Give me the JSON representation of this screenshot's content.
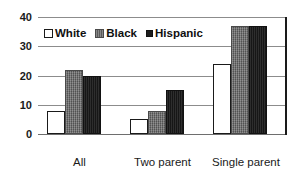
{
  "chart_data": {
    "type": "bar",
    "title": "",
    "subtitle": "",
    "xlabel": "",
    "ylabel": "",
    "ylim": [
      0,
      40
    ],
    "yticks": [
      0,
      10,
      20,
      30,
      40
    ],
    "grid": true,
    "legend_position": "inside-top-left",
    "categories": [
      "All\nfamilies",
      "Two parent\nfamilies",
      "Single parent\nfamilies"
    ],
    "series": [
      {
        "name": "White",
        "values": [
          8,
          5,
          24
        ],
        "fill": "#ffffff",
        "pattern": "open-outline"
      },
      {
        "name": "Black",
        "values": [
          22,
          8,
          37
        ],
        "fill": "#6b6b6b",
        "pattern": "gray-hatched"
      },
      {
        "name": "Hispanic",
        "values": [
          20,
          15,
          37
        ],
        "fill": "#1c1c1c",
        "pattern": "solid-black"
      }
    ]
  },
  "axis": {
    "y_tick_labels": [
      "40",
      "30",
      "20",
      "10",
      "0"
    ]
  },
  "legend": {
    "items": [
      {
        "label": "White",
        "marker": "open-square-icon"
      },
      {
        "label": "Black",
        "marker": "hatched-square-icon"
      },
      {
        "label": "Hispanic",
        "marker": "filled-square-icon"
      }
    ]
  },
  "x_categories": [
    {
      "line1": "All",
      "line2": "families"
    },
    {
      "line1": "Two parent",
      "line2": "families"
    },
    {
      "line1": "Single parent",
      "line2": "families"
    }
  ],
  "colors": {
    "white_series": "#ffffff",
    "black_series": "#6b6b6b",
    "hispanic_series": "#1c1c1c",
    "gridline": "#8c8c8c",
    "axis_border": "#1a1a1a",
    "background": "#ffffff"
  }
}
